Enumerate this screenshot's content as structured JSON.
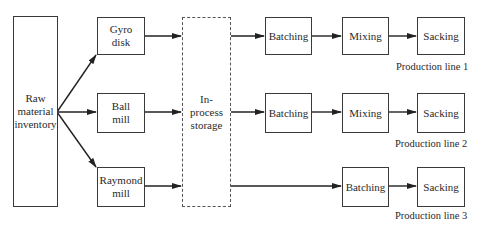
{
  "diagram": {
    "source": {
      "label": "Raw material inventory",
      "lines": [
        "Raw",
        "material",
        "inventory"
      ]
    },
    "grinders": [
      {
        "id": "gyro",
        "lines": [
          "Gyro",
          "disk"
        ]
      },
      {
        "id": "ball",
        "lines": [
          "Ball",
          "mill"
        ]
      },
      {
        "id": "raymond",
        "lines": [
          "Raymond",
          "mill"
        ]
      }
    ],
    "storage": {
      "lines": [
        "In-",
        "process",
        "storage"
      ]
    },
    "production_lines": [
      {
        "name": "Production line 1",
        "steps": [
          "Batching",
          "Mixing",
          "Sacking"
        ]
      },
      {
        "name": "Production line 2",
        "steps": [
          "Batching",
          "Mixing",
          "Sacking"
        ]
      },
      {
        "name": "Production line 3",
        "steps": [
          "Batching",
          "Sacking"
        ]
      }
    ]
  }
}
